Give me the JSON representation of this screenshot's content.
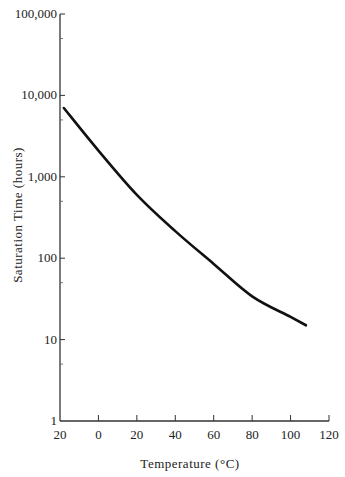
{
  "chart_data": {
    "type": "line",
    "title": "",
    "xlabel": "Temperature (°C)",
    "ylabel": "Saturation Time (hours)",
    "x_ticks": [
      "20",
      "0",
      "20",
      "40",
      "60",
      "80",
      "100",
      "120"
    ],
    "x_tick_values": [
      -20,
      0,
      20,
      40,
      60,
      80,
      100,
      120
    ],
    "y_ticks": [
      "1",
      "10",
      "1,000",
      "100",
      "10,000",
      "100,000"
    ],
    "y_tick_labels_ordered": [
      "1",
      "10",
      "100",
      "1,000",
      "10,000",
      "100,000"
    ],
    "y_tick_values": [
      1,
      10,
      100,
      1000,
      10000,
      100000
    ],
    "xlim": [
      -20,
      120
    ],
    "ylim": [
      1,
      100000
    ],
    "yscale": "log",
    "grid": false,
    "legend": null,
    "series": [
      {
        "name": "Saturation Time",
        "x": [
          -18,
          0,
          20,
          40,
          60,
          80,
          100,
          108
        ],
        "values": [
          7000,
          2100,
          600,
          215,
          85,
          34,
          19,
          15
        ]
      }
    ]
  },
  "labels": {
    "xlabel": "Temperature (°C)",
    "ylabel": "Saturation Time (hours)"
  }
}
